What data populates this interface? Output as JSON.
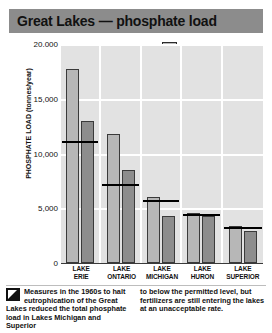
{
  "title": "Great Lakes — phosphate load",
  "legend": {
    "items": [
      {
        "label": "1976",
        "swatch": "light-gray-square",
        "color": "#b7b7b7"
      },
      {
        "label": "1982",
        "swatch": "dark-gray-square",
        "color": "#8d8d8d"
      },
      {
        "label": "PERMITTED LOAD",
        "swatch": "black-line",
        "color": "#000000"
      }
    ]
  },
  "caption": {
    "icon": "arrow-marker-icon",
    "left": "Measures in the 1960s to halt eutrophication of the Great Lakes reduced the total phosphate load in Lakes Michigan and Superior",
    "right": "to below the permitted level, but fertilizers are still entering the lakes at an unacceptable rate."
  },
  "chart_data": {
    "type": "bar",
    "title": "Great Lakes — phosphate load",
    "xlabel": "",
    "ylabel": "PHOSPHATE LOAD (tonnes/year)",
    "ylim": [
      0,
      20000
    ],
    "yticks": [
      0,
      5000,
      10000,
      15000,
      20000
    ],
    "ytick_labels": [
      "0",
      "5,000",
      "10,000",
      "15,000",
      "20.000"
    ],
    "grid": true,
    "legend_position": "top-right",
    "categories": [
      "LAKE ERIE",
      "LAKE ONTARIO",
      "LAKE MICHIGAN",
      "LAKE HURON",
      "LAKE SUPERIOR"
    ],
    "category_lines": [
      [
        "LAKE",
        "ERIE"
      ],
      [
        "LAKE",
        "ONTARIO"
      ],
      [
        "LAKE",
        "MICHIGAN"
      ],
      [
        "LAKE",
        "HURON"
      ],
      [
        "LAKE",
        "SUPERIOR"
      ]
    ],
    "series": [
      {
        "name": "1976",
        "values": [
          17700,
          11800,
          6000,
          4600,
          3400
        ]
      },
      {
        "name": "1982",
        "values": [
          13000,
          8500,
          4300,
          4300,
          2900
        ]
      },
      {
        "name": "PERMITTED LOAD",
        "type": "line-marker",
        "values": [
          11000,
          7000,
          5600,
          4300,
          3100
        ]
      }
    ]
  }
}
